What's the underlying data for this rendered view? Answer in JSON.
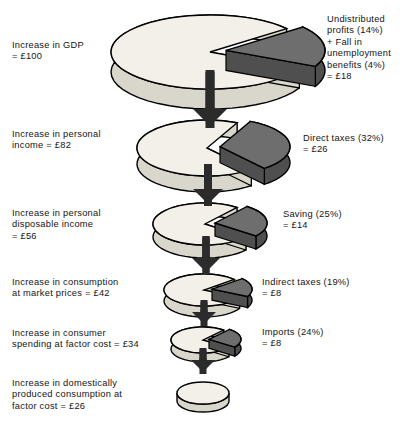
{
  "figure": {
    "currency_symbol": "£",
    "colors": {
      "pie_top": "#f2f0e9",
      "pie_side": "#d9d6cb",
      "leak_slice": "#6e6e6e",
      "leak_slice_side": "#4f4f4f",
      "outline": "#000000",
      "arrow": "#2b2b2b",
      "text": "#141414",
      "background": "#ffffff"
    }
  },
  "stages": [
    {
      "id": "gdp",
      "left_label": "Increase in GDP\n= £100",
      "left_value": 100,
      "right_label": "Undistributed\nprofits (14%)\n+ Fall in\nunemployment\nbenefits (4%)\n= £18",
      "right_value": 18,
      "leak_percent": 18,
      "pie_radius": 99
    },
    {
      "id": "personal-income",
      "left_label": "Increase in personal\nincome = £82",
      "left_value": 82,
      "right_label": "Direct taxes (32%)\n= £26",
      "right_value": 26,
      "leak_percent": 32,
      "pie_radius": 70
    },
    {
      "id": "personal-disposable-income",
      "left_label": "Increase in personal\ndisposable income\n= £56",
      "left_value": 56,
      "right_label": "Saving (25%)\n= £14",
      "right_value": 14,
      "leak_percent": 25,
      "pie_radius": 52
    },
    {
      "id": "consumption-market-prices",
      "left_label": "Increase in consumption\nat market prices = £42",
      "left_value": 42,
      "right_label": "Indirect taxes (19%)\n= £8",
      "right_value": 8,
      "leak_percent": 19,
      "pie_radius": 40
    },
    {
      "id": "consumer-spending-factor-cost",
      "left_label": "Increase in consumer\nspending at factor cost = £34",
      "left_value": 34,
      "right_label": "Imports (24%)\n= £8",
      "right_value": 8,
      "leak_percent": 24,
      "pie_radius": 32
    },
    {
      "id": "domestic-consumption-factor-cost",
      "left_label": "Increase in domestically\nproduced consumption at\nfactor cost = £26",
      "left_value": 26,
      "right_label": "",
      "right_value": null,
      "leak_percent": 0,
      "pie_radius": 26
    }
  ],
  "chart_data": {
    "type": "pie",
    "units": "£ (index, GDP = 100)",
    "series": [
      {
        "stage": "Increase in GDP",
        "total": 100,
        "leakage_name": "Undistributed profits + Fall in unemployment benefits",
        "leakage_percent": 18,
        "leakage_value": 18,
        "remainder": 82
      },
      {
        "stage": "Increase in personal income",
        "total": 82,
        "leakage_name": "Direct taxes",
        "leakage_percent": 32,
        "leakage_value": 26,
        "remainder": 56
      },
      {
        "stage": "Increase in personal disposable income",
        "total": 56,
        "leakage_name": "Saving",
        "leakage_percent": 25,
        "leakage_value": 14,
        "remainder": 42
      },
      {
        "stage": "Increase in consumption at market prices",
        "total": 42,
        "leakage_name": "Indirect taxes",
        "leakage_percent": 19,
        "leakage_value": 8,
        "remainder": 34
      },
      {
        "stage": "Increase in consumer spending at factor cost",
        "total": 34,
        "leakage_name": "Imports",
        "leakage_percent": 24,
        "leakage_value": 8,
        "remainder": 26
      },
      {
        "stage": "Increase in domestically produced consumption at factor cost",
        "total": 26,
        "leakage_name": null,
        "leakage_percent": 0,
        "leakage_value": null,
        "remainder": 26
      }
    ],
    "legend": "none",
    "grid": false
  }
}
